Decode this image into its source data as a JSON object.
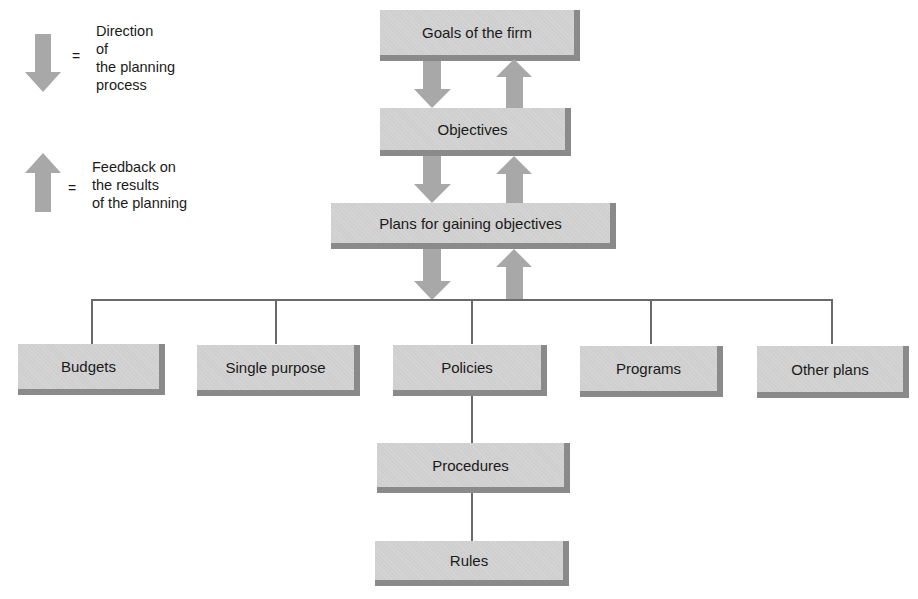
{
  "legend": {
    "down_arrow": {
      "icon": "down-arrow-icon",
      "equals": "=",
      "lines": [
        "Direction",
        "of",
        "the planning",
        "process"
      ]
    },
    "up_arrow": {
      "icon": "up-arrow-icon",
      "equals": "=",
      "lines": [
        "Feedback on",
        "the results",
        "of the planning"
      ]
    }
  },
  "nodes": {
    "goals": "Goals of the firm",
    "objectives": "Objectives",
    "plans": "Plans for gaining objectives",
    "budgets": "Budgets",
    "single_purpose": "Single purpose",
    "policies": "Policies",
    "programs": "Programs",
    "other_plans": "Other plans",
    "procedures": "Procedures",
    "rules": "Rules"
  },
  "colors": {
    "box_fill": "#cfcfcf",
    "box_shadow": "#8a8a8a",
    "arrow": "#a8a8a8",
    "connector": "#6a6a6a"
  }
}
